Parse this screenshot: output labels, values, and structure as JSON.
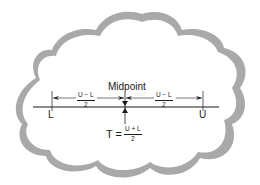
{
  "diagram": {
    "title": "Midpoint",
    "lower_limit_label": "L",
    "upper_limit_label": "U",
    "left_half_width": {
      "numerator": "U − L",
      "denominator": "2"
    },
    "right_half_width": {
      "numerator": "U − L",
      "denominator": "2"
    },
    "target_formula": {
      "lhs": "T =",
      "numerator": "U + L",
      "denominator": "2"
    },
    "colors": {
      "cloud_outline": "#a9a9a9",
      "ink": "#1a1a1a",
      "background": "#ffffff"
    }
  }
}
